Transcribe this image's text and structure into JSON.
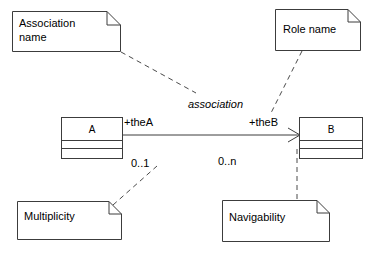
{
  "diagram": {
    "kind": "uml-class-association-notation",
    "canvas": {
      "width": 387,
      "height": 260,
      "background": "#ffffff"
    },
    "colors": {
      "stroke": "#3c3c3c",
      "fill": "#ffffff",
      "text": "#000000",
      "leader": "#4a4a4a"
    },
    "notes": [
      {
        "id": "association-name",
        "label_line1": "Association",
        "label_line2": "name",
        "icon": "note-folded-corner-icon"
      },
      {
        "id": "role-name",
        "label_line1": "Role name",
        "label_line2": "",
        "icon": "note-folded-corner-icon"
      },
      {
        "id": "multiplicity",
        "label_line1": "Multiplicity",
        "label_line2": "",
        "icon": "note-folded-corner-icon"
      },
      {
        "id": "navigability",
        "label_line1": "Navigability",
        "label_line2": "",
        "icon": "note-folded-corner-icon"
      }
    ],
    "classes": [
      {
        "id": "class-a",
        "name": "A",
        "compartments": 3
      },
      {
        "id": "class-b",
        "name": "B",
        "compartments": 3
      }
    ],
    "association": {
      "name": "association",
      "name_style": "italic",
      "source_role": "+theA",
      "target_role": "+theB",
      "source_multiplicity": "0..1",
      "target_multiplicity": "0..n",
      "arrow": "open-arrowhead-icon",
      "arrow_direction": "to-class-b"
    }
  }
}
